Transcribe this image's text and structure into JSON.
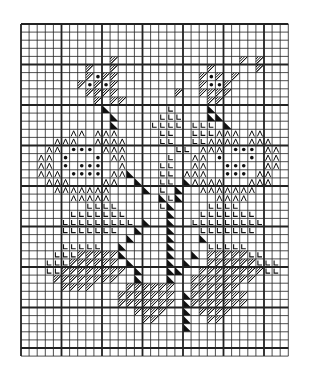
{
  "grid": {
    "cols": 33,
    "rows": 41,
    "cell": 8.1,
    "major_every": 5
  },
  "colors": {
    "line": "#222222",
    "ink": "#111111",
    "paper": "#ffffff"
  },
  "legend": {
    ".": "empty",
    "/": "diagonal-hatch",
    "o": "dot",
    "^": "arch",
    "L": "l-symbol",
    "t": "black-triangle"
  },
  "pattern": [
    ".................................",
    ".................................",
    ".................................",
    ".................................",
    ".........../..............././...",
    "......../../.........../...../...",
    "......../o//........../o/./......",
    "......./o/o/........../oo/.......",
    "........////......./..////.......",
    "........././/..........//........",
    "..........t.......L....t.........",
    "...........t.....LLL...tt........",
    "...........t....LLLL.LLL.t.......",
    "......^^.^^^.....LL..LLL^^^.^^...",
    "....^^^..^^^^....LL..LL^^^^.^^^..",
    "...^^.ooo.^^^......LL.^^^.ooo.^^.",
    "..^^.o...o.^^.....L..^^.o...o.^^.",
    "..^^.o.ooo..^....LL..^^..ooo..^^.",
    "..^^^.oooo.^^t...LL.^^^..ooo.^^..",
    "...^^^....^^..t..LL.t^^^^...^^^..",
    "....^^^^^^^....t.L.t..^^^^^^^....",
    "......^^^^^......tLt....^^^^.....",
    "........LLLL.....Lt....LLLL......",
    "......LLLLLLL.....t...LLLLLLL....",
    ".....LLLLLLLLL.t..t..LLLLLLLLL...",
    ".....LLLLLLL..t...t...LLLLLLL....",
    ".............t....t...t..........",
    ".....LLLLL..t.....t....LLLLL.....",
    "....LLL/////t.....t..t./////LL...",
    "...LLL//////.t....t.t..//////LLL.",
    "...LL////////.t...tt..////////LL.",
    "....////////..t...t..////////....",
    ".....////....//////..//////......",
    "............///////.t///////.....",
    "............///////.t///////.....",
    "..............////..t.////.......",
    "...............//...t..//........",
    "....................t............",
    ".................................",
    ".................................",
    "................................."
  ]
}
